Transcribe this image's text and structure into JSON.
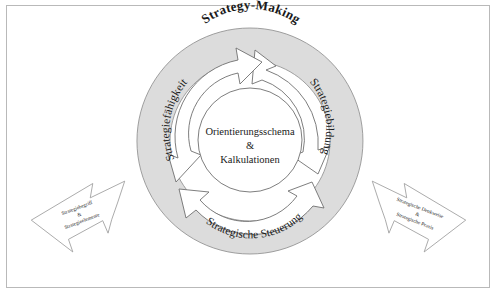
{
  "figure": {
    "type": "cycle-diagram",
    "language": "de",
    "title": "Strategy-Making",
    "center": {
      "line1": "Orientierungsschema",
      "line2": "&",
      "line3": "Kalkulationen"
    },
    "cycle_labels": [
      {
        "id": "strategiebildung",
        "text": "Strategiebildung",
        "position": "right"
      },
      {
        "id": "strategische-steuerung",
        "text": "Strategische Steuerung",
        "position": "bottom"
      },
      {
        "id": "strategiefaehigkeit",
        "text": "Strategiefähigkeit",
        "position": "left"
      }
    ],
    "flanking_arrows": [
      {
        "id": "left-arrow",
        "direction": "points-up-right",
        "line1": "Strategiebegriff",
        "line2": "&",
        "line3": "Strategieelemente"
      },
      {
        "id": "right-arrow",
        "direction": "points-down-left",
        "line1": "Strategische Denkweise",
        "line2": "&",
        "line3": "Strategische Praxis"
      }
    ],
    "colors": {
      "ring_fill": "#dcdcdc",
      "ring_stroke": "#8a8a8a",
      "arrow_fill": "#ffffff",
      "arrow_stroke": "#6f6f6f",
      "center_fill": "#ffffff",
      "text": "#1a1a1a",
      "frame_border": "#b9b9b9",
      "page_background": "#ffffff"
    }
  }
}
